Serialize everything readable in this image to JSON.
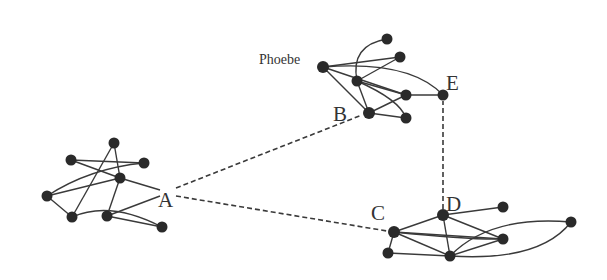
{
  "diagram": {
    "labels": {
      "A": "A",
      "B": "B",
      "C": "C",
      "D": "D",
      "E": "E",
      "phoebe": "Phoebe"
    },
    "clusters": [
      {
        "name": "left-cluster",
        "node_count": 8,
        "entry_label": "A"
      },
      {
        "name": "top-cluster",
        "node_count": 8,
        "entry_labels": [
          "B",
          "E"
        ],
        "named_node": "Phoebe"
      },
      {
        "name": "bottom-right-cluster",
        "node_count": 7,
        "entry_labels": [
          "C",
          "D"
        ]
      }
    ],
    "dashed_links": [
      {
        "from": "A",
        "to": "B"
      },
      {
        "from": "A",
        "to": "C"
      },
      {
        "from": "D",
        "to": "E"
      }
    ],
    "colors": {
      "background": "#ffffff",
      "node": "#2a2a2a",
      "edge": "#3a3a3a",
      "text": "#333333"
    }
  }
}
